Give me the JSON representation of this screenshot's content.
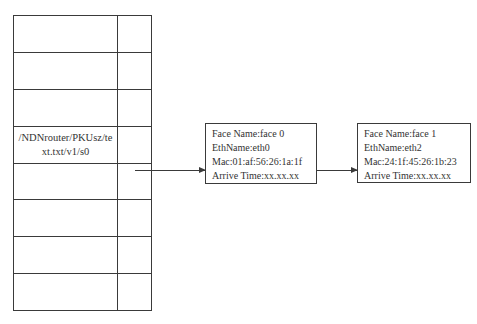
{
  "diagram": {
    "type": "pit-table-to-face-list",
    "table": {
      "rows": [
        {
          "name": "",
          "pointer": ""
        },
        {
          "name": "",
          "pointer": ""
        },
        {
          "name": "",
          "pointer": ""
        },
        {
          "name": "/NDNrouter/PKUsz/text.txt/v1/s0",
          "pointer": "arrow"
        },
        {
          "name": "",
          "pointer": ""
        },
        {
          "name": "",
          "pointer": ""
        },
        {
          "name": "",
          "pointer": ""
        },
        {
          "name": "",
          "pointer": ""
        }
      ]
    },
    "faces": [
      {
        "face_name": "Face Name:face 0",
        "eth_name": "EthName:eth0",
        "mac": "Mac:01:af:56:26:1a:1f",
        "arrive_time": "Arrive Time:xx.xx.xx"
      },
      {
        "face_name": "Face Name:face 1",
        "eth_name": "EthName:eth2",
        "mac": "Mac:24:1f:45:26:1b:23",
        "arrive_time": "Arrive Time:xx.xx.xx"
      }
    ],
    "colors": {
      "line": "#3a3a3a",
      "text": "#333333",
      "background": "#ffffff"
    }
  }
}
